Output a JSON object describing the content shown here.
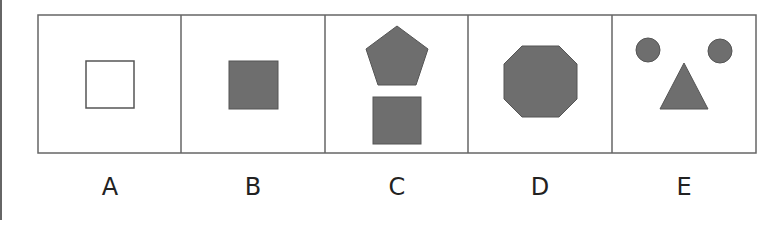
{
  "options": [
    {
      "label": "A",
      "shapes": [
        "hollow-square"
      ]
    },
    {
      "label": "B",
      "shapes": [
        "filled-square"
      ]
    },
    {
      "label": "C",
      "shapes": [
        "filled-pentagon",
        "filled-square"
      ]
    },
    {
      "label": "D",
      "shapes": [
        "filled-octagon"
      ]
    },
    {
      "label": "E",
      "shapes": [
        "filled-circle",
        "filled-circle",
        "filled-triangle"
      ]
    }
  ],
  "colors": {
    "fill": "#6e6e6e",
    "stroke": "#555555",
    "border": "#666666"
  }
}
